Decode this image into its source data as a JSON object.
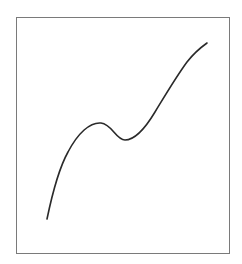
{
  "figure": {
    "frame_color": "#7a7a7a",
    "curve_color": "#2a2a2a",
    "background": "#ffffff"
  }
}
